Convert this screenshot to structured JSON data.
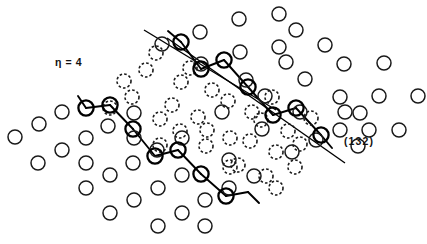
{
  "figure": {
    "domain_type": "crystal-lattice-diagram",
    "background_color": "#ffffff",
    "stroke_color": "#000000",
    "width": 427,
    "height": 244,
    "labels": {
      "eta": "η = 4",
      "plane_index": "(132)"
    }
  },
  "legend_semantics": {
    "open_circle": "matrix lattice site",
    "dashed_circle": "displaced / inner domain site",
    "bold_circle": "boundary chain site",
    "solid_line": "(132) habit plane trace"
  },
  "chart_data": {
    "type": "scatter",
    "title": "",
    "subtitle": "",
    "xlabel": "",
    "ylabel": "",
    "xlim": [
      0,
      427
    ],
    "ylim": [
      244,
      0
    ],
    "grid": false,
    "legend_position": "none",
    "annotations": [
      {
        "text": "η = 4",
        "x": 55,
        "y": 64,
        "name": "eta-annotation"
      },
      {
        "text": "(132)",
        "x": 344,
        "y": 143,
        "name": "plane-index-annotation"
      }
    ],
    "series": [
      {
        "name": "open-lattice-circles",
        "marker": "open-circle",
        "radius": 7.0,
        "stroke_width": 1.5,
        "points": [
          [
            239,
            19
          ],
          [
            279,
            14
          ],
          [
            200,
            32
          ],
          [
            240,
            52
          ],
          [
            279,
            47
          ],
          [
            296,
            30
          ],
          [
            162,
            44
          ],
          [
            201,
            64
          ],
          [
            246,
            80
          ],
          [
            286,
            62
          ],
          [
            325,
            45
          ],
          [
            305,
            79
          ],
          [
            265,
            96
          ],
          [
            344,
            64
          ],
          [
            340,
            97
          ],
          [
            300,
            112
          ],
          [
            262,
            129
          ],
          [
            222,
            112
          ],
          [
            384,
            63
          ],
          [
            379,
            96
          ],
          [
            360,
            113
          ],
          [
            418,
            96
          ],
          [
            399,
            130
          ],
          [
            358,
            146
          ],
          [
            340,
            130
          ],
          [
            15,
            137
          ],
          [
            39,
            124
          ],
          [
            62,
            112
          ],
          [
            38,
            163
          ],
          [
            62,
            150
          ],
          [
            86,
            138
          ],
          [
            108,
            126
          ],
          [
            86,
            188
          ],
          [
            110,
            175
          ],
          [
            133,
            163
          ],
          [
            157,
            150
          ],
          [
            110,
            213
          ],
          [
            134,
            200
          ],
          [
            158,
            188
          ],
          [
            182,
            175
          ],
          [
            158,
            226
          ],
          [
            182,
            213
          ],
          [
            205,
            200
          ],
          [
            229,
            188
          ],
          [
            205,
            226
          ],
          [
            254,
            176
          ],
          [
            86,
            163
          ],
          [
            134,
            138
          ],
          [
            182,
            138
          ],
          [
            134,
            113
          ],
          [
            292,
            152
          ],
          [
            316,
            140
          ],
          [
            369,
            130
          ],
          [
            345,
            112
          ],
          [
            229,
            160
          ]
        ]
      },
      {
        "name": "dashed-inner-circles",
        "marker": "dashed-circle",
        "radius": 7.0,
        "stroke_width": 1.6,
        "points": [
          [
            156,
            53
          ],
          [
            124,
            81
          ],
          [
            146,
            70
          ],
          [
            132,
            97
          ],
          [
            181,
            82
          ],
          [
            190,
            68
          ],
          [
            172,
            105
          ],
          [
            212,
            90
          ],
          [
            160,
            119
          ],
          [
            198,
            117
          ],
          [
            228,
            101
          ],
          [
            160,
            145
          ],
          [
            230,
            138
          ],
          [
            206,
            146
          ],
          [
            272,
            97
          ],
          [
            261,
            120
          ],
          [
            250,
            141
          ],
          [
            288,
            131
          ],
          [
            238,
            165
          ],
          [
            276,
            152
          ],
          [
            300,
            144
          ],
          [
            266,
            176
          ],
          [
            230,
            167
          ],
          [
            207,
            130
          ],
          [
            180,
            131
          ],
          [
            110,
            108
          ],
          [
            252,
            112
          ],
          [
            295,
            167
          ],
          [
            276,
            188
          ],
          [
            311,
            118
          ]
        ]
      },
      {
        "name": "bold-boundary-chain",
        "marker": "bold-circle",
        "radius": 7.6,
        "stroke_width": 2.3,
        "points": [
          [
            181,
            42
          ],
          [
            201,
            69
          ],
          [
            224,
            60
          ],
          [
            248,
            87
          ],
          [
            273,
            115
          ],
          [
            296,
            108
          ],
          [
            321,
            135
          ],
          [
            86,
            108
          ],
          [
            110,
            105
          ],
          [
            133,
            129
          ],
          [
            155,
            156
          ],
          [
            178,
            150
          ],
          [
            201,
            174
          ],
          [
            226,
            196
          ]
        ]
      }
    ],
    "bonds": [
      {
        "name": "chain-bond",
        "from": [
          168,
          31
        ],
        "to": [
          181,
          42
        ]
      },
      {
        "name": "chain-bond",
        "from": [
          181,
          42
        ],
        "to": [
          201,
          69
        ]
      },
      {
        "name": "chain-bond",
        "from": [
          201,
          69
        ],
        "to": [
          224,
          60
        ]
      },
      {
        "name": "chain-bond",
        "from": [
          224,
          60
        ],
        "to": [
          248,
          87
        ]
      },
      {
        "name": "chain-bond",
        "from": [
          248,
          87
        ],
        "to": [
          273,
          115
        ]
      },
      {
        "name": "chain-bond",
        "from": [
          273,
          115
        ],
        "to": [
          296,
          108
        ]
      },
      {
        "name": "chain-bond",
        "from": [
          296,
          108
        ],
        "to": [
          321,
          135
        ]
      },
      {
        "name": "chain-bond",
        "from": [
          321,
          135
        ],
        "to": [
          332,
          148
        ]
      },
      {
        "name": "chain-bond",
        "from": [
          78,
          96
        ],
        "to": [
          86,
          108
        ]
      },
      {
        "name": "chain-bond",
        "from": [
          86,
          108
        ],
        "to": [
          110,
          105
        ]
      },
      {
        "name": "chain-bond",
        "from": [
          110,
          105
        ],
        "to": [
          133,
          129
        ]
      },
      {
        "name": "chain-bond",
        "from": [
          133,
          129
        ],
        "to": [
          155,
          156
        ]
      },
      {
        "name": "chain-bond",
        "from": [
          155,
          156
        ],
        "to": [
          178,
          150
        ]
      },
      {
        "name": "chain-bond",
        "from": [
          178,
          150
        ],
        "to": [
          201,
          174
        ]
      },
      {
        "name": "chain-bond",
        "from": [
          201,
          174
        ],
        "to": [
          226,
          196
        ]
      },
      {
        "name": "chain-bond",
        "from": [
          226,
          196
        ],
        "to": [
          248,
          192
        ]
      },
      {
        "name": "chain-bond",
        "from": [
          248,
          192
        ],
        "to": [
          259,
          203
        ]
      }
    ],
    "plane_lines": [
      {
        "name": "plane-line-upper",
        "x1": 144,
        "y1": 30,
        "x2": 276,
        "y2": 110
      },
      {
        "name": "plane-line-lower",
        "x1": 167,
        "y1": 38,
        "x2": 345,
        "y2": 163
      }
    ]
  }
}
